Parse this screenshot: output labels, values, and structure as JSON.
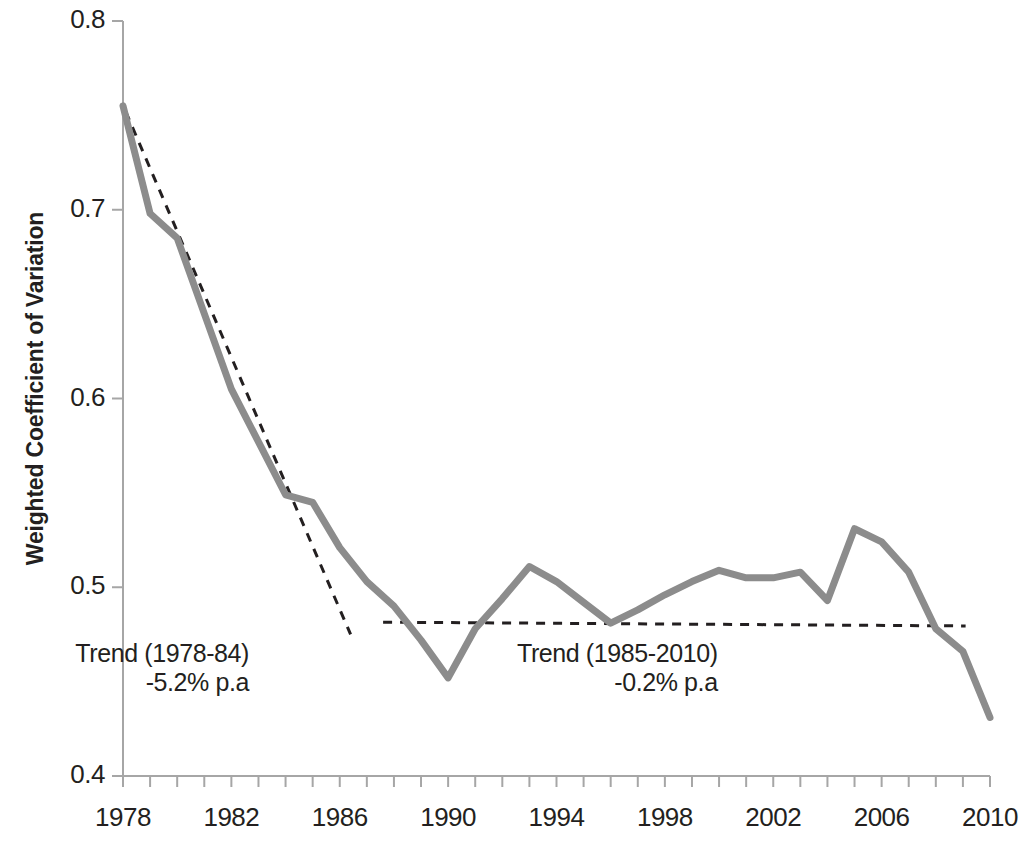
{
  "chart_data": {
    "type": "line",
    "title": "",
    "subtitle": "",
    "xlabel": "",
    "ylabel": "Weighted Coefficient of Variation",
    "xlim": [
      1978,
      2010
    ],
    "ylim": [
      0.4,
      0.8
    ],
    "grid": false,
    "legend": "none",
    "x": [
      1978,
      1979,
      1980,
      1981,
      1982,
      1983,
      1984,
      1985,
      1986,
      1987,
      1988,
      1989,
      1990,
      1991,
      1992,
      1993,
      1994,
      1995,
      1996,
      1997,
      1998,
      1999,
      2000,
      2001,
      2002,
      2003,
      2004,
      2005,
      2006,
      2007,
      2008,
      2009,
      2010
    ],
    "series": [
      {
        "name": "Weighted Coefficient of Variation",
        "color": "#8c8c8c",
        "style": "solid",
        "width": 7,
        "values": [
          0.755,
          0.698,
          0.685,
          0.645,
          0.605,
          0.577,
          0.549,
          0.545,
          0.521,
          0.503,
          0.49,
          0.472,
          0.452,
          0.478,
          0.494,
          0.511,
          0.503,
          0.492,
          0.481,
          0.488,
          0.496,
          0.503,
          0.509,
          0.505,
          0.505,
          0.508,
          0.493,
          0.531,
          0.524,
          0.508,
          0.478,
          0.466,
          0.431
        ]
      }
    ],
    "trendlines": [
      {
        "name": "trend-1978-1984",
        "style": "dashed",
        "color": "#231f20",
        "width": 3,
        "x_start": 1978.1,
        "y_start": 0.752,
        "x_end": 1986.4,
        "y_end": 0.475
      },
      {
        "name": "trend-1985-2010",
        "style": "dashed",
        "color": "#231f20",
        "width": 3,
        "x_start": 1987.6,
        "y_start": 0.4815,
        "x_end": 2009.1,
        "y_end": 0.4795
      }
    ],
    "annotations": [
      {
        "name": "trend-1978-84-annotation",
        "line1": "Trend (1978-84)",
        "line2": "-5.2% p.a",
        "x": 1980.3,
        "y": 0.463
      },
      {
        "name": "trend-1985-2010-annotation",
        "line1": "Trend (1985-2010)",
        "line2": "-0.2% p.a",
        "x": 1996.6,
        "y": 0.463
      }
    ],
    "yticks": [
      0.8,
      0.7,
      0.6,
      0.5,
      0.4
    ],
    "ytick_labels": [
      "0.8",
      "0.7",
      "0.6",
      "0.5",
      "0.4"
    ],
    "xticks": [
      1978,
      1979,
      1980,
      1981,
      1982,
      1983,
      1984,
      1985,
      1986,
      1987,
      1988,
      1989,
      1990,
      1991,
      1992,
      1993,
      1994,
      1995,
      1996,
      1997,
      1998,
      1999,
      2000,
      2001,
      2002,
      2003,
      2004,
      2005,
      2006,
      2007,
      2008,
      2009,
      2010
    ],
    "xtick_labels_shown": [
      "1978",
      "1982",
      "1986",
      "1990",
      "1994",
      "1998",
      "2002",
      "2006",
      "2010"
    ],
    "xtick_labels_shown_values": [
      1978,
      1982,
      1986,
      1990,
      1994,
      1998,
      2002,
      2006,
      2010
    ],
    "axis_color": "#a6a6a6",
    "background": "#ffffff"
  }
}
